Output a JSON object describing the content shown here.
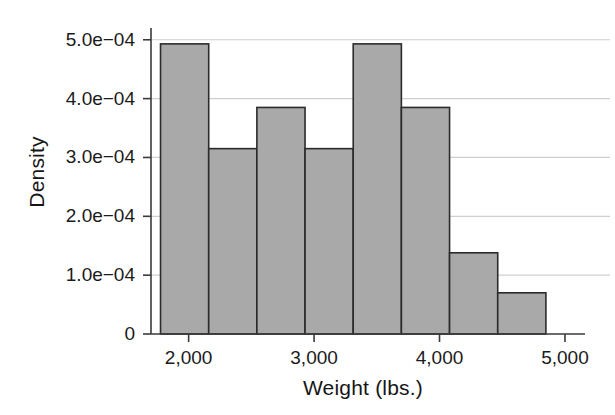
{
  "chart_data": {
    "type": "bar",
    "title": "",
    "subtitle": "",
    "xlabel": "Weight (lbs.)",
    "ylabel": "Density",
    "grid": true,
    "legend": false,
    "legend_position": "none",
    "xlim": [
      1700,
      5080
    ],
    "ylim": [
      0,
      0.00052
    ],
    "xticks": [
      2000,
      3000,
      4000,
      5000
    ],
    "xtick_labels": [
      "2,000",
      "3,000",
      "4,000",
      "5,000"
    ],
    "yticks": [
      0,
      0.0001,
      0.0002,
      0.0003,
      0.0004,
      0.0005
    ],
    "ytick_labels": [
      "0",
      "1.0e−04",
      "2.0e−04",
      "3.0e−04",
      "4.0e−04",
      "5.0e−04"
    ],
    "bin_edges": [
      1776,
      2160,
      2544,
      2928,
      3312,
      3696,
      4080,
      4464,
      4848
    ],
    "bin_width": 384,
    "categories": [
      "1776–2160",
      "2160–2544",
      "2544–2928",
      "2928–3312",
      "3312–3696",
      "3696–4080",
      "4080–4464",
      "4464–4848"
    ],
    "values": [
      0.000493,
      0.000315,
      0.000385,
      0.000315,
      0.000493,
      0.000385,
      0.000138,
      7e-05
    ],
    "bar_fill_color": "#a9a9a9",
    "bar_edge_color": "#2b2b2b",
    "grid_color": "#cfcfcf",
    "axis_color": "#3a3a3a"
  }
}
